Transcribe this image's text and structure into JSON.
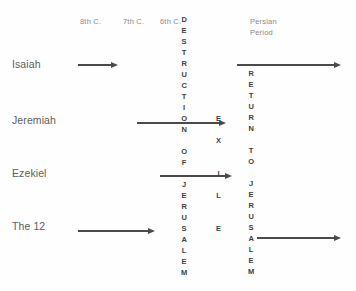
{
  "diagram": {
    "background_color": "#fefefe",
    "ink_color": "#4a4a4a",
    "label_color": "#5d5d5d",
    "era_color": "#8a8a8a"
  },
  "eras": [
    {
      "id": "era-8th",
      "label": "8th C.",
      "x": 80,
      "y": 17
    },
    {
      "id": "era-7th",
      "label": "7th C.",
      "x": 123,
      "y": 17
    },
    {
      "id": "era-6th",
      "label": "6th C.",
      "x": 160,
      "y": 17
    },
    {
      "id": "era-persian-1",
      "label": "Persian",
      "x": 250,
      "y": 17
    },
    {
      "id": "era-persian-2",
      "label": "Period",
      "x": 250,
      "y": 28
    }
  ],
  "rows": [
    {
      "id": "row-isaiah",
      "label": "Isaiah",
      "label_x": 12,
      "label_y": 58
    },
    {
      "id": "row-jeremiah",
      "label": "Jeremiah",
      "label_x": 12,
      "label_y": 114
    },
    {
      "id": "row-ezekiel",
      "label": "Ezekiel",
      "label_x": 12,
      "label_y": 167
    },
    {
      "id": "row-the-12",
      "label": "The 12",
      "label_x": 12,
      "label_y": 220
    }
  ],
  "arrows": [
    {
      "id": "arrow-isaiah-left",
      "row": "Isaiah",
      "x": 78,
      "y": 62,
      "length": 40
    },
    {
      "id": "arrow-isaiah-right",
      "row": "Isaiah",
      "x": 237,
      "y": 62,
      "length": 104
    },
    {
      "id": "arrow-jeremiah",
      "row": "Jeremiah",
      "x": 137,
      "y": 120,
      "length": 89
    },
    {
      "id": "arrow-ezekiel",
      "row": "Ezekiel",
      "x": 160,
      "y": 173,
      "length": 72
    },
    {
      "id": "arrow-the12-left",
      "row": "The 12",
      "x": 78,
      "y": 228,
      "length": 77
    },
    {
      "id": "arrow-the12-right",
      "row": "The 12",
      "x": 257,
      "y": 235,
      "length": 84
    }
  ],
  "columns": [
    {
      "id": "column-destruction-of-jerusalem",
      "text": "DESTRUCTION OF JERUSALEM",
      "x": 181,
      "y": 14,
      "letters": [
        "D",
        "E",
        "S",
        "T",
        "R",
        "U",
        "C",
        "T",
        "I",
        "O",
        "N",
        " ",
        "O",
        "F",
        " ",
        "J",
        "E",
        "R",
        "U",
        "S",
        "A",
        "L",
        "E",
        "M"
      ]
    },
    {
      "id": "column-exile",
      "text": "EXILE",
      "x": 216,
      "y": 113,
      "letters": [
        "E",
        " ",
        "X",
        " ",
        " ",
        "I",
        " ",
        "L",
        " ",
        " ",
        "E"
      ]
    },
    {
      "id": "column-return-to-jerusalem",
      "text": "RETURN TO JERUSALEM",
      "x": 248,
      "y": 68,
      "letters": [
        "R",
        "E",
        "T",
        "U",
        "R",
        "N",
        " ",
        "T",
        "O",
        " ",
        "J",
        "E",
        "R",
        "U",
        "S",
        "A",
        "L",
        "E",
        "M"
      ]
    }
  ]
}
